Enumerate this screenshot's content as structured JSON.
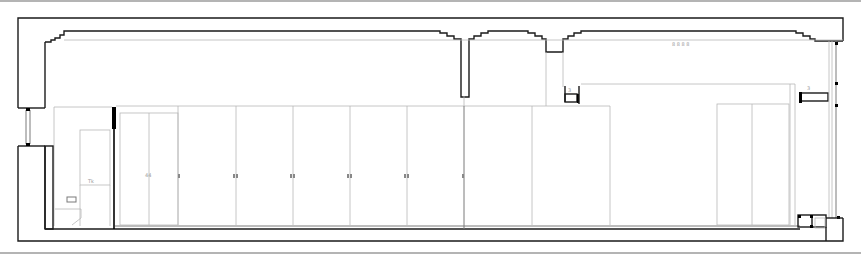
{
  "drawing": {
    "type": "architectural section elevation",
    "width": 861,
    "height": 259,
    "colors": {
      "background": "#ffffff",
      "wall": "#1a1a1a",
      "fixture": "#b8b8b8",
      "frame": "#6a6a6a"
    },
    "annotations": {
      "ceiling_marker": "8 8 8 8",
      "toilet_marker": "Tk",
      "cabinet_marker": "44",
      "detail_left": "3",
      "detail_right": "3"
    }
  },
  "cabinets": {
    "wardrobe_dividers_x": [
      178,
      236,
      293,
      350,
      407,
      464
    ],
    "handles_x": [
      180,
      234,
      291,
      348,
      405,
      462
    ],
    "right_panels_x": [
      532,
      610
    ],
    "right_unit_x": [
      717,
      752,
      789
    ]
  }
}
